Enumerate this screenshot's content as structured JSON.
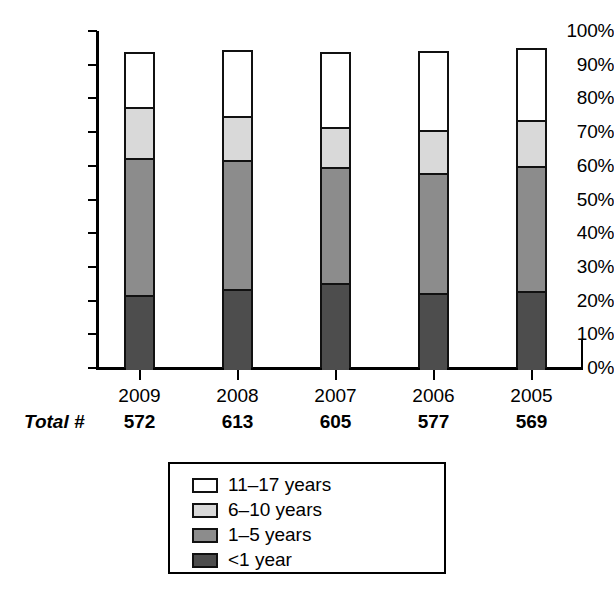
{
  "chart_data": {
    "type": "bar",
    "subtype": "stacked-bar-100-percent",
    "title": "",
    "xlabel": "",
    "ylabel": "",
    "ylim": [
      0,
      100
    ],
    "y_tick_labels": [
      "100%",
      "90%",
      "80%",
      "70%",
      "60%",
      "50%",
      "40%",
      "30%",
      "20%",
      "10%",
      "0%"
    ],
    "y_tick_values": [
      100,
      90,
      80,
      70,
      60,
      50,
      40,
      30,
      20,
      10,
      0
    ],
    "grid": false,
    "legend_position": "bottom-center",
    "categories": [
      "2009",
      "2008",
      "2007",
      "2006",
      "2005"
    ],
    "totals_label": "Total #",
    "totals": [
      "572",
      "613",
      "605",
      "577",
      "569"
    ],
    "series": [
      {
        "name": "<1 year",
        "color": "#4d4d4d",
        "values": [
          22.3,
          24.0,
          25.8,
          22.8,
          23.4
        ]
      },
      {
        "name": "1–5 years",
        "color": "#8c8c8c",
        "values": [
          40.7,
          38.3,
          34.4,
          35.7,
          37.1
        ]
      },
      {
        "name": "6–10 years",
        "color": "#d9d9d9",
        "values": [
          15.1,
          13.1,
          11.9,
          12.8,
          13.6
        ]
      },
      {
        "name": "11–17 years",
        "color": "#ffffff",
        "values": [
          15.7,
          18.9,
          21.8,
          22.8,
          20.8
        ]
      }
    ],
    "stack_tops": {
      "2009": {
        "dark_top": 22.3,
        "mid_top": 63.0,
        "light_top": 78.1,
        "white_top": 93.8
      },
      "2008": {
        "dark_top": 24.0,
        "mid_top": 62.3,
        "light_top": 75.4,
        "white_top": 94.4
      },
      "2007": {
        "dark_top": 25.8,
        "mid_top": 60.2,
        "light_top": 72.1,
        "white_top": 93.9
      },
      "2006": {
        "dark_top": 22.8,
        "mid_top": 58.5,
        "light_top": 71.3,
        "white_top": 94.1
      },
      "2005": {
        "dark_top": 23.4,
        "mid_top": 60.5,
        "light_top": 74.1,
        "white_top": 94.9
      }
    }
  },
  "legend": {
    "items": [
      {
        "label": "11–17 years",
        "swatch": "#ffffff"
      },
      {
        "label": "6–10 years",
        "swatch": "#d9d9d9"
      },
      {
        "label": "1–5 years",
        "swatch": "#8c8c8c"
      },
      {
        "label": "<1 year",
        "swatch": "#4d4d4d"
      }
    ]
  }
}
